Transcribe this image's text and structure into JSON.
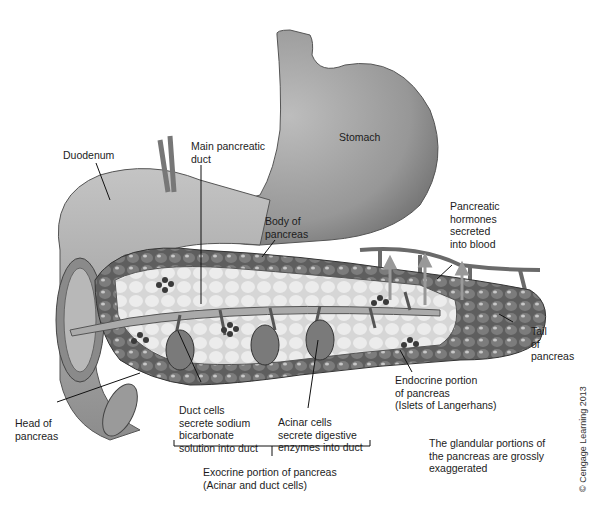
{
  "diagram": {
    "labels": {
      "duodenum": "Duodenum",
      "main_duct": "Main pancreatic\nduct",
      "stomach": "Stomach",
      "body": "Body of\npancreas",
      "hormones": "Pancreatic\nhormones\nsecreted\ninto blood",
      "tail": "Tail\nof\npancreas",
      "head": "Head of\npancreas",
      "duct_cells": "Duct cells\nsecrete sodium\nbicarbonate\nsolution into duct",
      "acinar_cells": "Acinar cells\nsecrete digestive\nenzymes into duct",
      "endocrine": "Endocrine portion\nof pancreas\n(Islets of Langerhans)",
      "exocrine": "Exocrine portion of pancreas\n(Acinar and duct cells)",
      "note": "The glandular portions of\nthe pancreas are grossly\nexaggerated",
      "copyright": "© Cengage Learning 2013"
    },
    "colors": {
      "stomach": "#9a9a9a",
      "duodenum": "#a8a8a8",
      "acinar": "#6e6e6e",
      "pancreas_light": "#e2e2e2",
      "islet": "#3a3a3a",
      "leader_line": "#111111"
    }
  }
}
